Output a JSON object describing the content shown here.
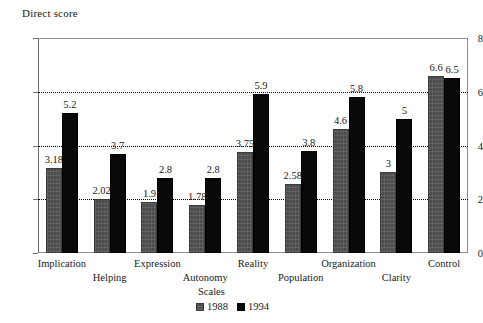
{
  "chart_data": {
    "type": "bar",
    "title": "",
    "xlabel": "Scales",
    "ylabel": "Direct score",
    "ylim": [
      0,
      8
    ],
    "ytick_values": [
      0,
      2,
      4,
      6,
      8
    ],
    "ytick_labels": [
      "0",
      "2",
      "4",
      "6",
      "8"
    ],
    "grid": true,
    "grid_axis": "y",
    "legend_position": "bottom-center",
    "categories": [
      "Implication",
      "Helping",
      "Expression",
      "Autonomy",
      "Reality",
      "Population",
      "Organization",
      "Clarity",
      "Control"
    ],
    "series": [
      {
        "name": "1988",
        "color": "#4d4d4d",
        "values": [
          3.18,
          2.02,
          1.9,
          1.78,
          3.75,
          2.58,
          4.6,
          3,
          6.6
        ],
        "labels": [
          "3.18",
          "2.02",
          "1.9",
          "1.78",
          "3.75",
          "2.58",
          "4.6",
          "3",
          "6.6"
        ]
      },
      {
        "name": "1994",
        "color": "#080808",
        "values": [
          5.2,
          3.7,
          2.8,
          2.8,
          5.9,
          3.8,
          5.8,
          5,
          6.5
        ],
        "labels": [
          "5.2",
          "3.7",
          "2.8",
          "2.8",
          "5.9",
          "3.8",
          "5.8",
          "5",
          "6.5"
        ]
      }
    ]
  }
}
